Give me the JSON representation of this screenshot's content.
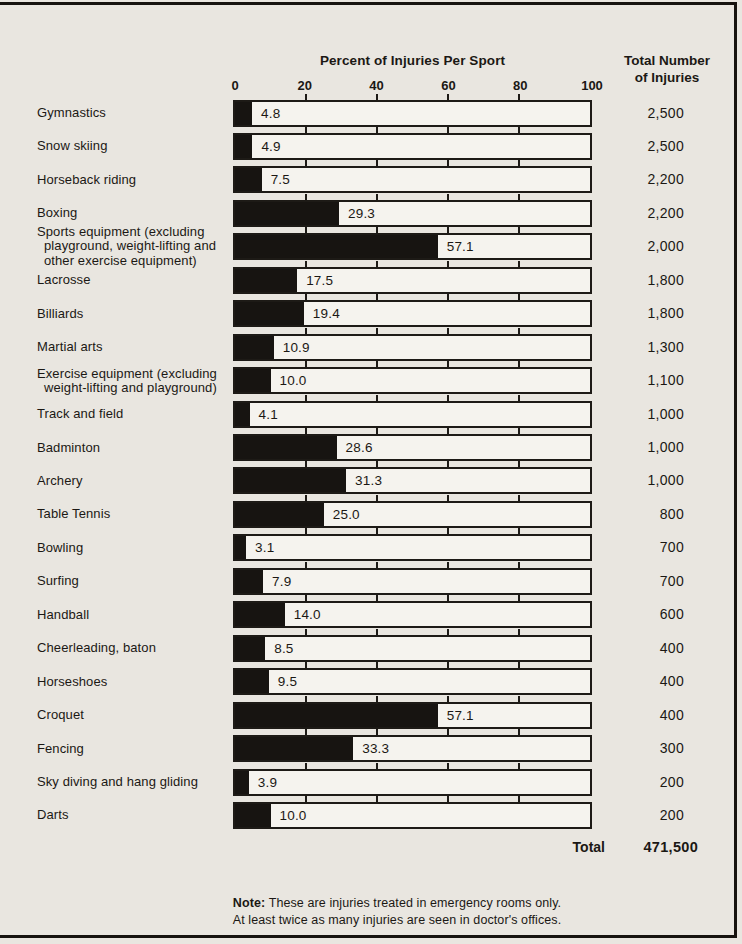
{
  "header": {
    "title": "Percent of Injuries Per Sport",
    "right_column_line1": "Total Number",
    "right_column_line2": "of  Injuries"
  },
  "summary": {
    "label": "Total",
    "value": "471,500"
  },
  "note": {
    "prefix": "Note:",
    "line1": "These are injuries treated in emergency rooms only.",
    "line2": "At least twice as many injuries are seen in doctor's offices."
  },
  "colors": {
    "paper": "#e9e6e0",
    "bar_interior": "#f5f3ee",
    "ink": "#171411"
  },
  "chart_data": {
    "type": "bar",
    "orientation": "horizontal",
    "title": "Percent of Injuries Per Sport",
    "xlabel": "",
    "ylabel": "",
    "xlim": [
      0,
      100
    ],
    "x_ticks": [
      0,
      20,
      40,
      60,
      80,
      100
    ],
    "x_tick_labels": [
      "0",
      "20",
      "40",
      "60",
      "80",
      "100"
    ],
    "right_column_header": "Total Number of Injuries",
    "rows": [
      {
        "label": "Gymnastics",
        "percent": 4.8,
        "percent_label": "4.8",
        "total": "2,500"
      },
      {
        "label": "Snow skiing",
        "percent": 4.9,
        "percent_label": "4.9",
        "total": "2,500"
      },
      {
        "label": "Horseback riding",
        "percent": 7.5,
        "percent_label": "7.5",
        "total": "2,200"
      },
      {
        "label": "Boxing",
        "percent": 29.3,
        "percent_label": "29.3",
        "total": "2,200"
      },
      {
        "label": "Sports equipment (excluding playground, weight-lifting and other exercise equipment)",
        "percent": 57.1,
        "percent_label": "57.1",
        "total": "2,000"
      },
      {
        "label": "Lacrosse",
        "percent": 17.5,
        "percent_label": "17.5",
        "total": "1,800"
      },
      {
        "label": "Billiards",
        "percent": 19.4,
        "percent_label": "19.4",
        "total": "1,800"
      },
      {
        "label": "Martial arts",
        "percent": 10.9,
        "percent_label": "10.9",
        "total": "1,300"
      },
      {
        "label": "Exercise equipment (excluding weight-lifting and playground)",
        "percent": 10.0,
        "percent_label": "10.0",
        "total": "1,100"
      },
      {
        "label": "Track and field",
        "percent": 4.1,
        "percent_label": "4.1",
        "total": "1,000"
      },
      {
        "label": "Badminton",
        "percent": 28.6,
        "percent_label": "28.6",
        "total": "1,000"
      },
      {
        "label": "Archery",
        "percent": 31.3,
        "percent_label": "31.3",
        "total": "1,000"
      },
      {
        "label": "Table Tennis",
        "percent": 25.0,
        "percent_label": "25.0",
        "total": "800"
      },
      {
        "label": "Bowling",
        "percent": 3.1,
        "percent_label": "3.1",
        "total": "700"
      },
      {
        "label": "Surfing",
        "percent": 7.9,
        "percent_label": "7.9",
        "total": "700"
      },
      {
        "label": "Handball",
        "percent": 14.0,
        "percent_label": "14.0",
        "total": "600"
      },
      {
        "label": "Cheerleading, baton",
        "percent": 8.5,
        "percent_label": "8.5",
        "total": "400"
      },
      {
        "label": "Horseshoes",
        "percent": 9.5,
        "percent_label": "9.5",
        "total": "400"
      },
      {
        "label": "Croquet",
        "percent": 57.1,
        "percent_label": "57.1",
        "total": "400"
      },
      {
        "label": "Fencing",
        "percent": 33.3,
        "percent_label": "33.3",
        "total": "300"
      },
      {
        "label": "Sky diving and hang gliding",
        "percent": 3.9,
        "percent_label": "3.9",
        "total": "200"
      },
      {
        "label": "Darts",
        "percent": 10.0,
        "percent_label": "10.0",
        "total": "200"
      }
    ],
    "grand_total": 471500,
    "grand_total_label": "Total",
    "grand_total_display": "471,500",
    "minor_ticks_per_bar": [
      20,
      40,
      60,
      80
    ],
    "grid": false,
    "legend": false
  }
}
